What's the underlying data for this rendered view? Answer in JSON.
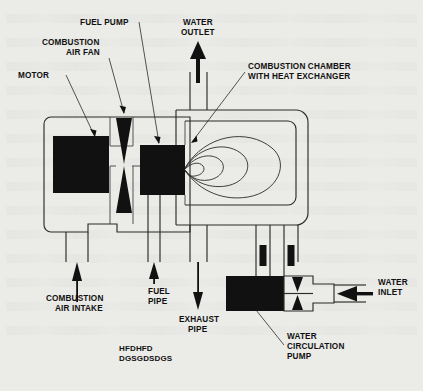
{
  "figure": {
    "background_color": "#e9e9e7",
    "ink_color": "#111111"
  },
  "labels": {
    "motor": "MOTOR",
    "combustion_air_fan_line1": "COMBUSTION",
    "combustion_air_fan_line2": "AIR FAN",
    "fuel_pump": "FUEL PUMP",
    "water_outlet_line1": "WATER",
    "water_outlet_line2": "OUTLET",
    "combustion_chamber_line1": "COMBUSTION CHAMBER",
    "combustion_chamber_line2": "WITH HEAT EXCHANGER",
    "combustion_air_intake_line1": "COMBUSTION",
    "combustion_air_intake_line2": "AIR INTAKE",
    "fuel_pipe_line1": "FUEL",
    "fuel_pipe_line2": "PIPE",
    "exhaust_pipe_line1": "EXHAUST",
    "exhaust_pipe_line2": "PIPE",
    "water_inlet_line1": "WATER",
    "water_inlet_line2": "INLET",
    "water_circulation_pump_line1": "WATER",
    "water_circulation_pump_line2": "CIRCULATION",
    "water_circulation_pump_line3": "PUMP",
    "placeholder_line1": "HFDHFD",
    "placeholder_line2": "DGSGDSDGS"
  },
  "icons": {
    "water_outlet_arrow": "arrow-up-icon",
    "water_inlet_arrow": "arrow-left-icon",
    "exhaust_arrow": "arrow-down-icon",
    "air_intake_arrow": "arrow-up-icon",
    "fuel_pipe_arrow": "arrow-up-icon"
  }
}
